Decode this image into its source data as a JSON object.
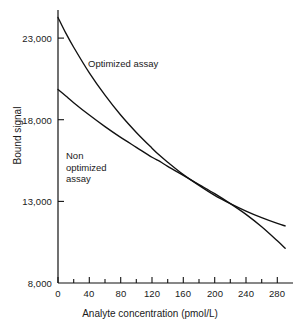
{
  "chart_data": {
    "type": "line",
    "title": "",
    "xlabel": "Analyte concentration (pmol/L)",
    "ylabel": "Bound signal",
    "xlim": [
      0,
      300
    ],
    "ylim": [
      8000,
      24500
    ],
    "xticks": [
      0,
      40,
      80,
      120,
      160,
      200,
      240,
      280
    ],
    "xtick_labels": [
      "0",
      "40",
      "80",
      "120",
      "160",
      "200",
      "240",
      "280"
    ],
    "yticks": [
      8000,
      13000,
      18000,
      23000
    ],
    "ytick_labels": [
      "8,000",
      "13,000",
      "18,000",
      "23,000"
    ],
    "minor_xticks": [
      20,
      60,
      100,
      140,
      180,
      220,
      260
    ],
    "grid": false,
    "legend": "inline-annotations",
    "line_color": "#111111",
    "background_color": "#ffffff",
    "annotations": [
      {
        "text": "Optimized assay",
        "x": 100,
        "y": 21000
      },
      {
        "text": "Non\noptimized\nassay",
        "x": 35,
        "y": 15600
      }
    ],
    "series": [
      {
        "name": "Optimized assay",
        "x": [
          0,
          10,
          20,
          40,
          60,
          80,
          100,
          120,
          130,
          140,
          160,
          180,
          200,
          220,
          240,
          260,
          280,
          290
        ],
        "values": [
          24050,
          23100,
          22250,
          20700,
          19350,
          18150,
          17100,
          16150,
          15700,
          15300,
          14550,
          13900,
          13300,
          12800,
          12350,
          11950,
          11600,
          11450
        ]
      },
      {
        "name": "Non optimized assay",
        "x": [
          0,
          10,
          20,
          40,
          60,
          80,
          100,
          120,
          130,
          140,
          160,
          180,
          200,
          220,
          240,
          260,
          280,
          290
        ],
        "values": [
          19700,
          19300,
          18900,
          18150,
          17450,
          16800,
          16200,
          15600,
          15350,
          15050,
          14500,
          13950,
          13400,
          12800,
          12150,
          11400,
          10550,
          10100
        ]
      }
    ],
    "crossover": {
      "x": 132,
      "y": 15200
    }
  },
  "axis_titles": {
    "x": "Analyte concentration (pmol/L)",
    "y": "Bound signal"
  },
  "annotations": {
    "optimized": "Optimized assay",
    "non_optimized": "Non\noptimized\nassay"
  }
}
